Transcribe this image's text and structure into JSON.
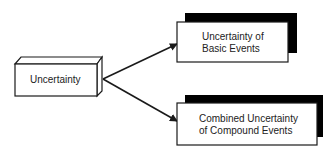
{
  "diagram": {
    "source_node": {
      "label": "Uncertainty"
    },
    "targets": [
      {
        "label_line1": "Uncertainty of",
        "label_line2": "Basic Events"
      },
      {
        "label_line1": "Combined Uncertainty",
        "label_line2": "of Compound Events"
      }
    ],
    "colors": {
      "stroke": "#1a1a1a",
      "shadow": "#000000",
      "fill": "#ffffff"
    }
  }
}
